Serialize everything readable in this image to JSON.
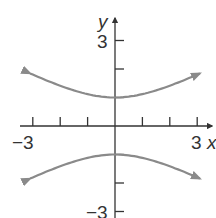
{
  "chart_data": {
    "type": "line",
    "title": "",
    "xlabel": "x",
    "ylabel": "y",
    "xlim": [
      -3,
      3
    ],
    "ylim": [
      -3,
      3
    ],
    "x_tick_labels": [
      "-3",
      "3"
    ],
    "y_tick_labels": [
      "3",
      "-3"
    ],
    "x_ticks": [
      -3,
      -2,
      -1,
      1,
      2,
      3
    ],
    "y_ticks": [
      -3,
      -2,
      -1,
      1,
      2,
      3
    ],
    "grid": false,
    "equation": "y^2 - x^2/4 = 1",
    "series": [
      {
        "name": "upper branch",
        "x": [
          -3.1,
          -2,
          -1,
          0,
          1,
          2,
          3.1
        ],
        "y": [
          1.84,
          1.41,
          1.12,
          1,
          1.12,
          1.41,
          1.84
        ]
      },
      {
        "name": "lower branch",
        "x": [
          -3.1,
          -2,
          -1,
          0,
          1,
          2,
          3.1
        ],
        "y": [
          -1.84,
          -1.41,
          -1.12,
          -1,
          -1.12,
          -1.41,
          -1.84
        ]
      }
    ],
    "colors": {
      "curve": "#8a8a8a",
      "axis": "#333333"
    }
  },
  "labels": {
    "x_axis": "x",
    "y_axis": "y",
    "x_min": "−3",
    "x_max": "3",
    "y_max": "3",
    "y_min": "−3"
  }
}
